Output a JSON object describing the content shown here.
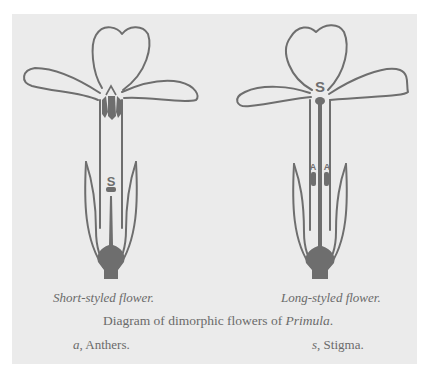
{
  "figure": {
    "background_color": "#ebebeb",
    "ink_color": "#6e6e6e",
    "left_flower": {
      "caption": "Short-styled flower.",
      "stigma_label": "S",
      "anther_label": "A"
    },
    "right_flower": {
      "caption": "Long-styled flower.",
      "stigma_label": "S",
      "anther_labels": [
        "A",
        "A"
      ]
    },
    "title_prefix": "Diagram of dimorphic flowers of ",
    "title_genus": "Primula",
    "title_suffix": ".",
    "legend": {
      "a_key": "a",
      "a_text": ", Anthers.",
      "s_key": "s",
      "s_text": ", Stigma."
    }
  }
}
